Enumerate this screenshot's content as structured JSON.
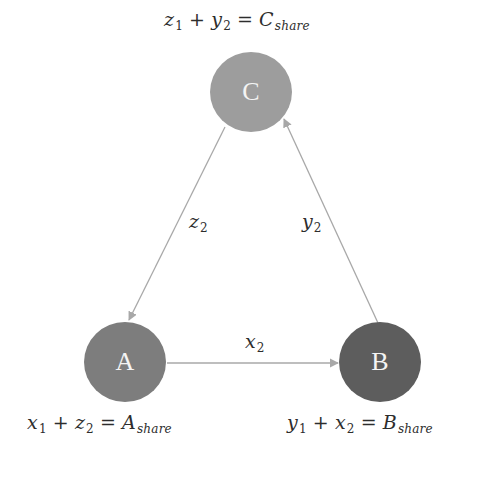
{
  "diagram": {
    "colors": {
      "background": "#ffffff",
      "edge": "#a8a8a8",
      "text": "#2d2d2d",
      "node_label": "#f4f4f4"
    },
    "nodes": [
      {
        "id": "C",
        "label": "C",
        "color": "#9d9d9d",
        "cx": 251,
        "cy": 92
      },
      {
        "id": "A",
        "label": "A",
        "color": "#7d7d7d",
        "cx": 125,
        "cy": 362
      },
      {
        "id": "B",
        "label": "B",
        "color": "#5d5d5d",
        "cx": 380,
        "cy": 362
      }
    ],
    "edges": [
      {
        "from": "C",
        "to": "A",
        "var": "z",
        "sub": "2"
      },
      {
        "from": "B",
        "to": "C",
        "var": "y",
        "sub": "2"
      },
      {
        "from": "A",
        "to": "B",
        "var": "x",
        "sub": "2"
      }
    ],
    "formulas": {
      "C": {
        "t1_var": "z",
        "t1_sub": "1",
        "plus": "+",
        "t2_var": "y",
        "t2_sub": "2",
        "eq": "=",
        "rhs_var": "C",
        "rhs_sub": "share"
      },
      "A": {
        "t1_var": "x",
        "t1_sub": "1",
        "plus": "+",
        "t2_var": "z",
        "t2_sub": "2",
        "eq": "=",
        "rhs_var": "A",
        "rhs_sub": "share"
      },
      "B": {
        "t1_var": "y",
        "t1_sub": "1",
        "plus": "+",
        "t2_var": "x",
        "t2_sub": "2",
        "eq": "=",
        "rhs_var": "B",
        "rhs_sub": "share"
      }
    }
  }
}
